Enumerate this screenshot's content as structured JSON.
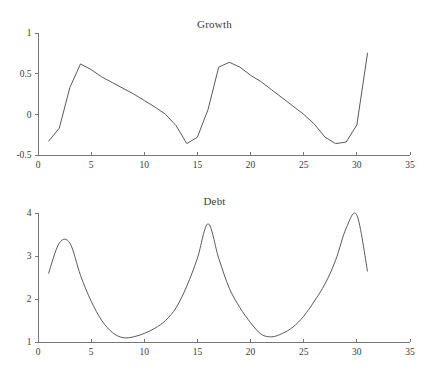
{
  "figure": {
    "background": "#ffffff",
    "line_color": "#5a5a5a",
    "axis_color": "#777777",
    "panel_count": 2
  },
  "chart_data": [
    {
      "type": "line",
      "title": "Growth",
      "xlabel": "",
      "ylabel": "",
      "xlim": [
        0,
        35
      ],
      "ylim": [
        -0.5,
        1
      ],
      "xticks": [
        0,
        5,
        10,
        15,
        20,
        25,
        30,
        35
      ],
      "xtick_labels": [
        "0",
        "5",
        "10",
        "15",
        "20",
        "25",
        "30",
        "35"
      ],
      "yticks": [
        -0.5,
        0,
        0.5,
        1
      ],
      "ytick_labels": [
        "-0.5",
        "0",
        "0.5",
        "1"
      ],
      "grid": false,
      "legend": false,
      "series": [
        {
          "name": "Growth",
          "x": [
            1,
            2,
            3,
            4,
            5,
            6,
            7,
            8,
            9,
            10,
            11,
            12,
            13,
            14,
            15,
            16,
            17,
            18,
            19,
            20,
            21,
            22,
            23,
            24,
            25,
            26,
            27,
            28,
            29,
            30,
            31
          ],
          "values": [
            -0.33,
            -0.17,
            0.33,
            0.62,
            0.55,
            0.46,
            0.39,
            0.32,
            0.25,
            0.17,
            0.09,
            0.0,
            -0.14,
            -0.36,
            -0.28,
            0.06,
            0.58,
            0.64,
            0.58,
            0.48,
            0.4,
            0.3,
            0.2,
            0.1,
            0.0,
            -0.12,
            -0.28,
            -0.36,
            -0.34,
            -0.13,
            0.75
          ]
        }
      ]
    },
    {
      "type": "line",
      "title": "Debt",
      "xlabel": "",
      "ylabel": "",
      "xlim": [
        0,
        35
      ],
      "ylim": [
        1,
        4
      ],
      "xticks": [
        0,
        5,
        10,
        15,
        20,
        25,
        30,
        35
      ],
      "xtick_labels": [
        "0",
        "5",
        "10",
        "15",
        "20",
        "25",
        "30",
        "35"
      ],
      "yticks": [
        1,
        2,
        3,
        4
      ],
      "ytick_labels": [
        "1",
        "2",
        "3",
        "4"
      ],
      "grid": false,
      "legend": false,
      "series": [
        {
          "name": "Debt",
          "x": [
            1,
            2,
            3,
            4,
            5,
            6,
            7,
            8,
            9,
            10,
            11,
            12,
            13,
            14,
            15,
            16,
            17,
            18,
            19,
            20,
            21,
            22,
            23,
            24,
            25,
            26,
            27,
            28,
            29,
            30,
            31
          ],
          "values": [
            2.6,
            3.3,
            3.3,
            2.55,
            1.95,
            1.5,
            1.22,
            1.1,
            1.12,
            1.2,
            1.32,
            1.5,
            1.8,
            2.3,
            2.95,
            3.75,
            2.95,
            2.25,
            1.8,
            1.45,
            1.18,
            1.12,
            1.2,
            1.35,
            1.6,
            1.95,
            2.35,
            2.9,
            3.65,
            3.95,
            2.65
          ]
        }
      ]
    }
  ]
}
